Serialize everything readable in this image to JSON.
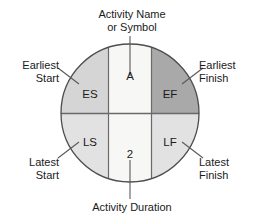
{
  "diagram": {
    "title_top": "Activity Name\nor Symbol",
    "title_bottom": "Activity Duration",
    "node": {
      "activity_name": "A",
      "activity_duration": "2",
      "earliest_start": "ES",
      "earliest_finish": "EF",
      "latest_start": "LS",
      "latest_finish": "LF"
    },
    "callouts": {
      "earliest_start": "Earliest\nStart",
      "latest_start": "Latest\nStart",
      "earliest_finish": "Earliest\nFinish",
      "latest_finish": "Latest\nFinish"
    },
    "colors": {
      "background": "#ffffff",
      "outline": "#4d4d4d",
      "quadrant_es": "#d5d5d5",
      "quadrant_ef": "#a9a9a9",
      "quadrant_ls": "#e2e2e2",
      "quadrant_lf": "#e2e2e2",
      "center_band": "#f7f7f5",
      "divider": "#6a6a6a",
      "text": "#1a1a1a",
      "leader": "#5a5a5a"
    },
    "geometry": {
      "center_x": 130,
      "center_y": 113,
      "radius": 69,
      "band_left": 108,
      "band_right": 152,
      "divider_y": 113
    }
  }
}
